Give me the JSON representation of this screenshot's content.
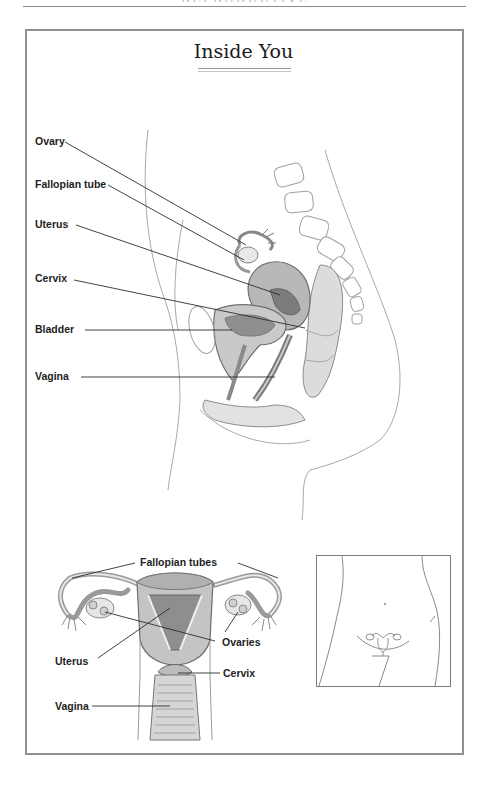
{
  "page": {
    "running_head": "REPRODUCTIVE ANATOMY"
  },
  "figure": {
    "title": "Inside You",
    "side_view": {
      "labels": [
        {
          "id": "ovary",
          "text": "Ovary"
        },
        {
          "id": "fallopian-tube",
          "text": "Fallopian tube"
        },
        {
          "id": "uterus",
          "text": "Uterus"
        },
        {
          "id": "cervix",
          "text": "Cervix"
        },
        {
          "id": "bladder",
          "text": "Bladder"
        },
        {
          "id": "vagina",
          "text": "Vagina"
        }
      ]
    },
    "front_view": {
      "labels": [
        {
          "id": "fallopian-tubes",
          "text": "Fallopian tubes"
        },
        {
          "id": "ovaries",
          "text": "Ovaries"
        },
        {
          "id": "uterus",
          "text": "Uterus"
        },
        {
          "id": "cervix",
          "text": "Cervix"
        },
        {
          "id": "vagina",
          "text": "Vagina"
        }
      ]
    },
    "inset": {
      "description": "Torso outline showing location of reproductive organs"
    }
  },
  "colors": {
    "frame": "#8f8f8f",
    "label_text": "#1e1e1e",
    "leader_line": "#333333",
    "organ_shade": "#9a9a9a"
  }
}
